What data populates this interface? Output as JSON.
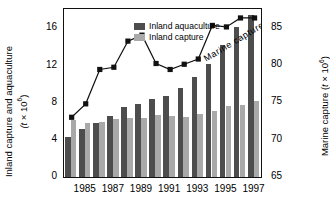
{
  "chart_data": {
    "type": "bar",
    "title": "",
    "xlabel": "",
    "categories": [
      1984,
      1985,
      1986,
      1987,
      1988,
      1989,
      1990,
      1991,
      1992,
      1993,
      1994,
      1995,
      1996,
      1997
    ],
    "tick_years": [
      1985,
      1987,
      1989,
      1991,
      1993,
      1995,
      1997
    ],
    "series": [
      {
        "name": "Inland aquaculture",
        "axis": "left",
        "type": "bar",
        "color": "#4d4d4d",
        "values": [
          4.3,
          5.2,
          5.8,
          6.6,
          7.5,
          7.9,
          8.4,
          8.7,
          9.6,
          10.8,
          12.2,
          14.2,
          16.2,
          17.5
        ]
      },
      {
        "name": "Inland capture",
        "axis": "left",
        "type": "bar",
        "color": "#a9a9a9",
        "values": [
          6.1,
          5.8,
          5.9,
          6.3,
          6.4,
          6.4,
          6.7,
          6.6,
          6.5,
          6.8,
          7.1,
          7.6,
          7.8,
          8.2
        ]
      },
      {
        "name": "Marine capture",
        "axis": "right",
        "type": "line",
        "color": "#111111",
        "values": [
          73.0,
          74.8,
          79.4,
          79.7,
          83.2,
          84.0,
          80.2,
          79.4,
          80.1,
          80.8,
          85.3,
          85.1,
          86.3,
          86.3
        ]
      }
    ],
    "left_axis": {
      "label": "Inland capture and aquaculture (t × 10⁶)",
      "label_line1": "Inland capture and aquaculture",
      "label_line2": "(t × 10",
      "label_exp": "6",
      "label_line2_end": ")",
      "ticks": [
        0,
        4,
        8,
        12,
        16
      ],
      "lim": [
        0,
        18.1
      ]
    },
    "right_axis": {
      "label": "Marine capture (t × 10⁶)",
      "label_start": "Marine capture (t × 10",
      "label_exp": "6",
      "label_end": ")",
      "ticks": [
        65,
        70,
        75,
        80,
        85
      ],
      "lim": [
        65,
        87.5
      ]
    },
    "legend": {
      "position": "top-left-inside",
      "entries": [
        {
          "label": "Inland aquaculture",
          "color": "#4d4d4d"
        },
        {
          "label": "Inland capture",
          "color": "#a9a9a9"
        }
      ]
    },
    "annotations": [
      {
        "text": "Marine capture",
        "rotated": true,
        "angle": -31
      }
    ],
    "grid": false
  }
}
